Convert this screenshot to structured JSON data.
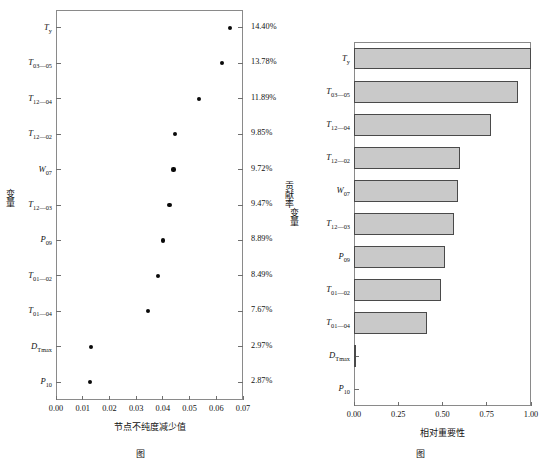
{
  "figure": {
    "width": 546,
    "height": 456
  },
  "chart_data": [
    {
      "type": "scatter",
      "name": "node-impurity-decrease-dotplot",
      "title": "",
      "xlabel": "节点不纯度减少值",
      "ylabel": "变量",
      "y2label": "贡献率",
      "xlim": [
        0.0,
        0.07
      ],
      "xticks": [
        "0.00",
        "0.01",
        "0.02",
        "0.03",
        "0.04",
        "0.05",
        "0.06",
        "0.07"
      ],
      "xtick_values": [
        0.0,
        0.01,
        0.02,
        0.03,
        0.04,
        0.05,
        0.06,
        0.07
      ],
      "grid": false,
      "legend": "none",
      "categories": [
        {
          "label_main": "T",
          "label_sub": "y"
        },
        {
          "label_main": "T",
          "label_sub": "03—05"
        },
        {
          "label_main": "T",
          "label_sub": "12—04"
        },
        {
          "label_main": "T",
          "label_sub": "12—02"
        },
        {
          "label_main": "W",
          "label_sub": "07"
        },
        {
          "label_main": "T",
          "label_sub": "12—03"
        },
        {
          "label_main": "P",
          "label_sub": "09"
        },
        {
          "label_main": "T",
          "label_sub": "01—02"
        },
        {
          "label_main": "T",
          "label_sub": "01—04"
        },
        {
          "label_main": "D",
          "label_sub": "Tmax"
        },
        {
          "label_main": "P",
          "label_sub": "10"
        }
      ],
      "values": [
        0.065,
        0.062,
        0.0535,
        0.0445,
        0.044,
        0.0425,
        0.04,
        0.0382,
        0.0345,
        0.013,
        0.0128
      ],
      "right_labels": [
        "14.40%",
        "13.78%",
        "11.89%",
        "9.85%",
        "9.72%",
        "9.47%",
        "8.89%",
        "8.49%",
        "7.67%",
        "2.97%",
        "2.87%"
      ]
    },
    {
      "type": "bar",
      "name": "relative-importance-barchart",
      "orientation": "horizontal",
      "title": "",
      "xlabel": "相对重要性",
      "ylabel": "变量",
      "xlim": [
        0.0,
        1.0
      ],
      "xticks": [
        "0.00",
        "0.25",
        "0.50",
        "0.75",
        "1.00"
      ],
      "xtick_values": [
        0.0,
        0.25,
        0.5,
        0.75,
        1.0
      ],
      "grid": false,
      "legend": "none",
      "bar_fill": "#c9c9c9",
      "bar_edge": "#4a4a4a",
      "categories": [
        {
          "label_main": "T",
          "label_sub": "y"
        },
        {
          "label_main": "T",
          "label_sub": "03—05"
        },
        {
          "label_main": "T",
          "label_sub": "12—04"
        },
        {
          "label_main": "T",
          "label_sub": "12—02"
        },
        {
          "label_main": "W",
          "label_sub": "07"
        },
        {
          "label_main": "T",
          "label_sub": "12—03"
        },
        {
          "label_main": "P",
          "label_sub": "09"
        },
        {
          "label_main": "T",
          "label_sub": "01—02"
        },
        {
          "label_main": "T",
          "label_sub": "01—04"
        },
        {
          "label_main": "D",
          "label_sub": "Tmax"
        },
        {
          "label_main": "P",
          "label_sub": "10"
        }
      ],
      "values": [
        1.0,
        0.925,
        0.775,
        0.6,
        0.59,
        0.565,
        0.515,
        0.49,
        0.415,
        0.01,
        0.0
      ]
    }
  ],
  "captions": {
    "left_prefix": "图",
    "left_number": "",
    "left_text": "",
    "right_prefix": "图",
    "right_number": "",
    "right_text": ""
  }
}
